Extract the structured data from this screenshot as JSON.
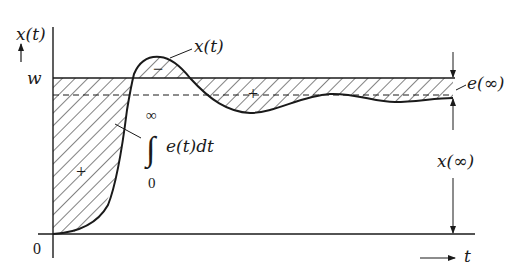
{
  "diagram": {
    "type": "step-response-error-integral",
    "colors": {
      "ink": "#1a1a1a",
      "background": "#ffffff"
    },
    "axes": {
      "y_label": "x(t)",
      "x_label": "t",
      "origin_label": "0",
      "reference_label": "w"
    },
    "annotations": {
      "curve_label": "x(t)",
      "region_minus": "−",
      "region_plus_left": "+",
      "region_plus_right": "+",
      "integral_upper": "∞",
      "integral_sign": "∫",
      "integral_lower": "0",
      "integral_expr": "e(t)dt",
      "steady_error_label": "e(∞)",
      "steady_value_label": "x(∞)"
    }
  }
}
